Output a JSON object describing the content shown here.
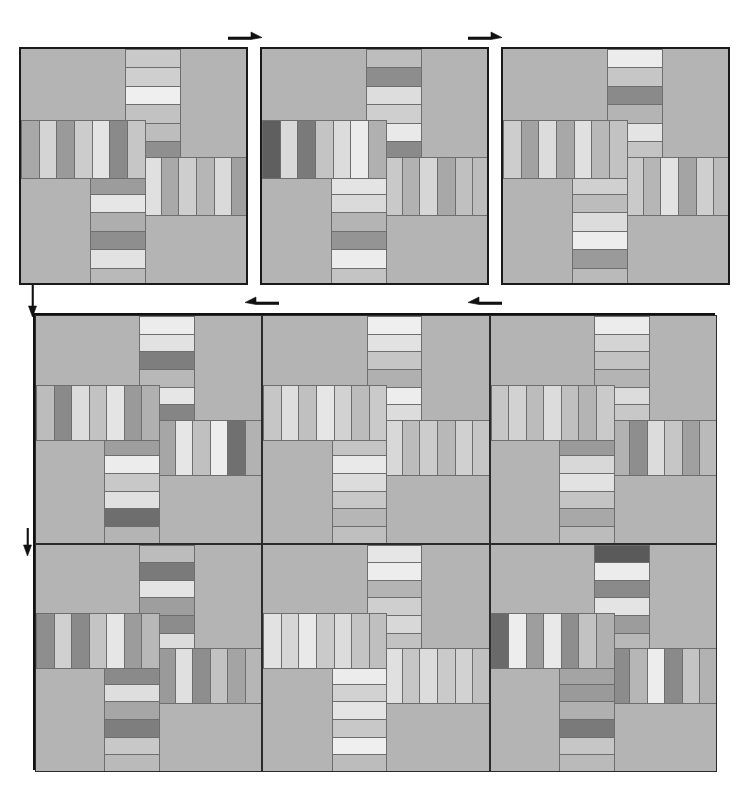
{
  "figure": {
    "background": "#ffffff",
    "width": 739,
    "height": 790,
    "block_fill": "#b4b4b4",
    "border_color": "#1a1a1a",
    "seam_color": "#6e6e6e",
    "palette": {
      "lightest": "#efefef",
      "light": "#e0e0e0",
      "light_mid": "#cfcfcf",
      "base": "#b4b4b4",
      "mid": "#a6a6a6",
      "mid_dark": "#949494",
      "dark": "#7d7d7d",
      "darker": "#6a6a6a",
      "darkest": "#555555"
    }
  },
  "arrows": [
    {
      "name": "arrow-top-1",
      "direction": "right",
      "x": 228,
      "y": 30,
      "length": 34
    },
    {
      "name": "arrow-top-2",
      "direction": "right",
      "x": 468,
      "y": 30,
      "length": 34
    },
    {
      "name": "arrow-left-down-1",
      "direction": "down",
      "x": 27,
      "y": 285,
      "length": 32
    },
    {
      "name": "arrow-mid-left-1",
      "direction": "left",
      "x": 245,
      "y": 295,
      "length": 34
    },
    {
      "name": "arrow-mid-left-2",
      "direction": "left",
      "x": 468,
      "y": 295,
      "length": 34
    },
    {
      "name": "arrow-left-down-2",
      "direction": "down",
      "x": 22,
      "y": 528,
      "length": 28
    }
  ],
  "top_row": {
    "name": "top-row-blocks",
    "y": 47,
    "height": 238,
    "blocks": [
      {
        "id": "top-block-1",
        "x": 19,
        "width": 229,
        "arms": [
          {
            "side": "top",
            "strips": [
              "#c9c9c9",
              "#cfcfcf",
              "#efefef",
              "#c2c2c2",
              "#bdbdbd",
              "#8f8f8f",
              "#b8b8b8"
            ]
          },
          {
            "side": "left",
            "strips": [
              "#a8a8a8",
              "#d4d4d4",
              "#9a9a9a",
              "#cccccc",
              "#e4e4e4",
              "#8a8a8a",
              "#c6c6c6"
            ]
          },
          {
            "side": "bottom",
            "strips": [
              "#bfbfbf",
              "#9c9c9c",
              "#e6e6e6",
              "#aeaeae",
              "#8e8e8e",
              "#e2e2e2",
              "#b9b9b9"
            ]
          },
          {
            "side": "right",
            "strips": [
              "#c4c4c4",
              "#e0e0e0",
              "#a9a9a9",
              "#cecece",
              "#b6b6b6",
              "#dadada",
              "#a0a0a0"
            ]
          }
        ]
      },
      {
        "id": "top-block-2",
        "x": 260,
        "width": 229,
        "arms": [
          {
            "side": "top",
            "strips": [
              "#bdbdbd",
              "#8d8d8d",
              "#dddddd",
              "#cfcfcf",
              "#e9e9e9",
              "#8a8a8a",
              "#a4a4a4"
            ]
          },
          {
            "side": "left",
            "strips": [
              "#5f5f5f",
              "#d9d9d9",
              "#7a7a7a",
              "#c4c4c4",
              "#dcdcdc",
              "#ececec",
              "#b0b0b0"
            ]
          },
          {
            "side": "bottom",
            "strips": [
              "#7d7d7d",
              "#e4e4e4",
              "#dadada",
              "#b4b4b4",
              "#949494",
              "#ececec",
              "#c4c4c4"
            ]
          },
          {
            "side": "right",
            "strips": [
              "#9e9e9e",
              "#c9c9c9",
              "#b2b2b2",
              "#d6d6d6",
              "#a8a8a8",
              "#c0c0c0",
              "#bcbcbc"
            ]
          }
        ]
      },
      {
        "id": "top-block-3",
        "x": 501,
        "width": 229,
        "arms": [
          {
            "side": "top",
            "strips": [
              "#ececec",
              "#c6c6c6",
              "#8a8a8a",
              "#b4b4b4",
              "#e4e4e4",
              "#c4c4c4",
              "#b0b0b0"
            ]
          },
          {
            "side": "left",
            "strips": [
              "#cdcdcd",
              "#a2a2a2",
              "#dcdcdc",
              "#a8a8a8",
              "#e0e0e0",
              "#b8b8b8",
              "#c2c2c2"
            ]
          },
          {
            "side": "bottom",
            "strips": [
              "#e9e9e9",
              "#d0d0d0",
              "#bcbcbc",
              "#dcdcdc",
              "#ededed",
              "#9a9a9a",
              "#bababa"
            ]
          },
          {
            "side": "right",
            "strips": [
              "#9c9c9c",
              "#cacaca",
              "#b6b6b6",
              "#e2e2e2",
              "#a4a4a4",
              "#cfcfcf",
              "#bbbbbb"
            ]
          }
        ]
      }
    ]
  },
  "grid": {
    "name": "big-grid",
    "x": 33,
    "y": 313,
    "width": 682,
    "height": 457,
    "cols": 3,
    "rows": 2,
    "cells": [
      {
        "id": "grid-cell-r1c1",
        "arms": [
          {
            "side": "top",
            "strips": [
              "#ececec",
              "#e2e2e2",
              "#7e7e7e",
              "#b8b8b8",
              "#e6e6e6",
              "#858585",
              "#aaaaaa"
            ]
          },
          {
            "side": "left",
            "strips": [
              "#bcbcbc",
              "#8a8a8a",
              "#dcdcdc",
              "#c2c2c2",
              "#e4e4e4",
              "#9a9a9a",
              "#b0b0b0"
            ]
          },
          {
            "side": "bottom",
            "strips": [
              "#bababa",
              "#9e9e9e",
              "#ececec",
              "#c8c8c8",
              "#e0e0e0",
              "#6e6e6e",
              "#b4b4b4"
            ]
          },
          {
            "side": "right",
            "strips": [
              "#dadada",
              "#a6a6a6",
              "#e6e6e6",
              "#c0c0c0",
              "#ededed",
              "#707070",
              "#b2b2b2"
            ]
          }
        ]
      },
      {
        "id": "grid-cell-r1c2",
        "arms": [
          {
            "side": "top",
            "strips": [
              "#efefef",
              "#e2e2e2",
              "#c6c6c6",
              "#b0b0b0",
              "#ededed",
              "#dcdcdc",
              "#b8b8b8"
            ]
          },
          {
            "side": "left",
            "strips": [
              "#c6c6c6",
              "#dedede",
              "#c0c0c0",
              "#e6e6e6",
              "#d2d2d2",
              "#bcbcbc",
              "#cacaca"
            ]
          },
          {
            "side": "bottom",
            "strips": [
              "#d2d2d2",
              "#c4c4c4",
              "#e9e9e9",
              "#dcdcdc",
              "#c8c8c8",
              "#b6b6b6",
              "#bfbfbf"
            ]
          },
          {
            "side": "right",
            "strips": [
              "#c2c2c2",
              "#d8d8d8",
              "#bcbcbc",
              "#cccccc",
              "#b8b8b8",
              "#d0d0d0",
              "#c6c6c6"
            ]
          }
        ]
      },
      {
        "id": "grid-cell-r1c3",
        "arms": [
          {
            "side": "top",
            "strips": [
              "#ececec",
              "#d4d4d4",
              "#c2c2c2",
              "#b4b4b4",
              "#dcdcdc",
              "#c8c8c8",
              "#b0b0b0"
            ]
          },
          {
            "side": "left",
            "strips": [
              "#c6c6c6",
              "#d2d2d2",
              "#bcbcbc",
              "#dcdcdc",
              "#c0c0c0",
              "#b4b4b4",
              "#cacaca"
            ]
          },
          {
            "side": "bottom",
            "strips": [
              "#b0b0b0",
              "#9a9a9a",
              "#d8d8d8",
              "#e2e2e2",
              "#c4c4c4",
              "#a8a8a8",
              "#bcbcbc"
            ]
          },
          {
            "side": "right",
            "strips": [
              "#cfcfcf",
              "#b2b2b2",
              "#8e8e8e",
              "#dcdcdc",
              "#c6c6c6",
              "#a0a0a0",
              "#bababa"
            ]
          }
        ]
      },
      {
        "id": "grid-cell-r2c1",
        "arms": [
          {
            "side": "top",
            "strips": [
              "#bcbcbc",
              "#7a7a7a",
              "#e4e4e4",
              "#9e9e9e",
              "#8c8c8c",
              "#dcdcdc",
              "#b4b4b4"
            ]
          },
          {
            "side": "left",
            "strips": [
              "#8e8e8e",
              "#d0d0d0",
              "#8a8a8a",
              "#c4c4c4",
              "#e6e6e6",
              "#9c9c9c",
              "#b8b8b8"
            ]
          },
          {
            "side": "bottom",
            "strips": [
              "#b4b4b4",
              "#8a8a8a",
              "#dedede",
              "#a6a6a6",
              "#7e7e7e",
              "#c8c8c8",
              "#bababa"
            ]
          },
          {
            "side": "right",
            "strips": [
              "#cacaca",
              "#9a9a9a",
              "#e0e0e0",
              "#8e8e8e",
              "#c2c2c2",
              "#a4a4a4",
              "#b6b6b6"
            ]
          }
        ]
      },
      {
        "id": "grid-cell-r2c2",
        "arms": [
          {
            "side": "top",
            "strips": [
              "#e6e6e6",
              "#ededed",
              "#b4b4b4",
              "#cfcfcf",
              "#d8d8d8",
              "#c2c2c2",
              "#bcbcbc"
            ]
          },
          {
            "side": "left",
            "strips": [
              "#e2e2e2",
              "#d6d6d6",
              "#e9e9e9",
              "#cacaca",
              "#dcdcdc",
              "#c4c4c4",
              "#bfbfbf"
            ]
          },
          {
            "side": "bottom",
            "strips": [
              "#dcdcdc",
              "#ececec",
              "#d2d2d2",
              "#e4e4e4",
              "#c8c8c8",
              "#efefef",
              "#bcbcbc"
            ]
          },
          {
            "side": "right",
            "strips": [
              "#d6d6d6",
              "#e0e0e0",
              "#c6c6c6",
              "#dcdcdc",
              "#cacaca",
              "#d2d2d2",
              "#c0c0c0"
            ]
          }
        ]
      },
      {
        "id": "grid-cell-r2c3",
        "arms": [
          {
            "side": "top",
            "strips": [
              "#5a5a5a",
              "#ececec",
              "#8a8a8a",
              "#e4e4e4",
              "#9c9c9c",
              "#b8b8b8",
              "#aeaeae"
            ]
          },
          {
            "side": "left",
            "strips": [
              "#6a6a6a",
              "#ededed",
              "#9e9e9e",
              "#e9e9e9",
              "#8e8e8e",
              "#c2c2c2",
              "#b0b0b0"
            ]
          },
          {
            "side": "bottom",
            "strips": [
              "#8c8c8c",
              "#a4a4a4",
              "#9a9a9a",
              "#b0b0b0",
              "#7a7a7a",
              "#c6c6c6",
              "#bababa"
            ]
          },
          {
            "side": "right",
            "strips": [
              "#a0a0a0",
              "#8c8c8c",
              "#b6b6b6",
              "#ededed",
              "#8a8a8a",
              "#c4c4c4",
              "#b2b2b2"
            ]
          }
        ]
      }
    ]
  }
}
